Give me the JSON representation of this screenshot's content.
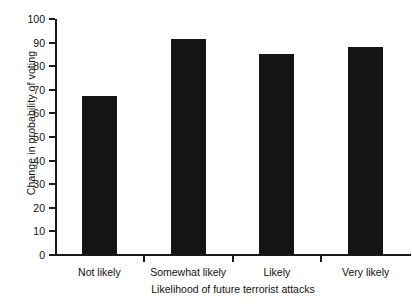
{
  "chart_data": {
    "type": "bar",
    "title": "",
    "categories": [
      "Not likely",
      "Somewhat likely",
      "Likely",
      "Very likely"
    ],
    "values": [
      67.5,
      91.5,
      85,
      88
    ],
    "xlabel": "Likelihood of future terrorist attacks",
    "ylabel": "Change in probability of voting",
    "ylim": [
      0,
      100
    ],
    "yticks": [
      0,
      10,
      20,
      30,
      40,
      50,
      60,
      70,
      80,
      90,
      100
    ],
    "ytick_labels": [
      "0",
      "10",
      "20",
      "30",
      "40",
      "50",
      "60",
      "70",
      "80",
      "90",
      "100"
    ],
    "grid": false,
    "legend": null,
    "bar_color": "#151515",
    "axis_color": "#1a1a1a",
    "background": "#ffffff"
  },
  "axes": {
    "y_title": "Change in probability of voting",
    "x_title": "Likelihood of future terrorist attacks"
  }
}
